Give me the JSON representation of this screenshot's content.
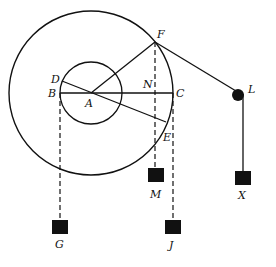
{
  "diagram": {
    "type": "pulley wheel-and-axle mechanics diagram",
    "colors": {
      "stroke": "#111111",
      "background": "#ffffff"
    },
    "labels": {
      "A": "A",
      "B": "B",
      "C": "C",
      "D": "D",
      "E": "E",
      "F": "F",
      "N": "N",
      "L": "L",
      "M": "M",
      "X": "X",
      "G": "G",
      "J": "J"
    },
    "elements": {
      "outer_circle": "outer wheel centered at A",
      "inner_circle": "inner axle centered at A",
      "line_BC": "horizontal diameter B–C through A",
      "line_DE": "line D–E through A",
      "line_AF": "radius A–F",
      "line_FL": "string from F over pulley L",
      "pulley_L": "small pulley at L",
      "weight_X": "weight X hanging from L",
      "weight_M": "weight M hanging from F (dashed)",
      "weight_G": "weight G hanging from B (dashed)",
      "weight_J": "weight J hanging from C (dashed)"
    }
  }
}
